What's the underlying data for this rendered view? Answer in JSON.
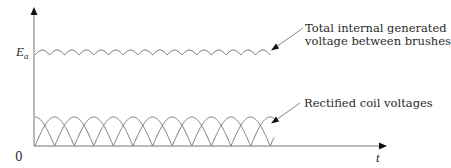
{
  "diagram": {
    "y_axis_label": "E",
    "y_axis_label_subscript": "a",
    "origin_label": "0",
    "x_axis_label": "t",
    "annotations": [
      {
        "line1": "Total internal generated",
        "line2": "voltage between brushes"
      },
      {
        "line1": "Rectified coil voltages"
      }
    ],
    "colors": {
      "line": "#555555",
      "axis": "#666666",
      "arrow": "#111111",
      "text": "#2a2a2a"
    }
  },
  "chart_data": {
    "type": "line",
    "title": "",
    "xlabel": "t",
    "ylabel": "E_a",
    "series": [
      {
        "name": "Total internal generated voltage between brushes",
        "description": "ripple of small rectified arcs near level E_a (16 arcs)"
      },
      {
        "name": "Rectified coil voltages",
        "description": "two interleaved trains of full-wave rectified half-sines, offset by quarter period"
      }
    ],
    "grid": false,
    "legend_position": "annotations-right"
  }
}
